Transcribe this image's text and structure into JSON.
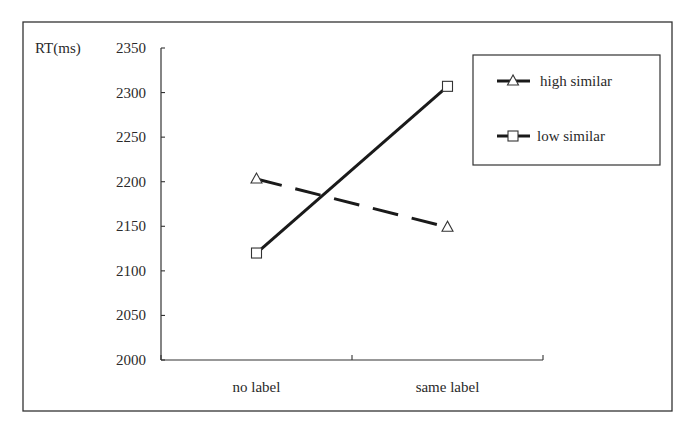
{
  "chart_data": {
    "type": "line",
    "title": "",
    "xlabel": "",
    "ylabel": "RT(ms)",
    "categories": [
      "no label",
      "same label"
    ],
    "series": [
      {
        "name": "high similar",
        "values": [
          2203,
          2149
        ],
        "marker": "triangle",
        "line_style": "dashed",
        "color": "#1a1a1a"
      },
      {
        "name": "low similar",
        "values": [
          2120,
          2307
        ],
        "marker": "square",
        "line_style": "solid",
        "color": "#1a1a1a"
      }
    ],
    "ylim": [
      2000,
      2350
    ],
    "yticks": [
      2000,
      2050,
      2100,
      2150,
      2200,
      2250,
      2300,
      2350
    ],
    "grid": false,
    "legend_position": "upper right"
  },
  "labels": {
    "ylabel": "RT(ms)",
    "legend": [
      "high similar",
      "low similar"
    ],
    "categories": [
      "no label",
      "same label"
    ]
  }
}
